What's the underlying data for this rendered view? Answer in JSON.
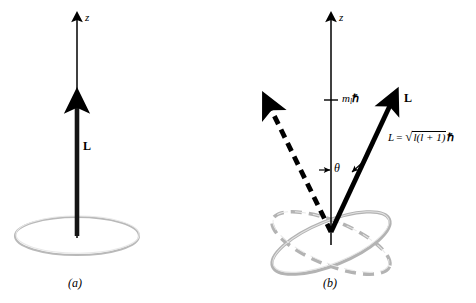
{
  "figure": {
    "background_color": "#ffffff",
    "ink_color": "#000000",
    "orbit_color": "#b3b3b3",
    "panels": [
      {
        "id": "a",
        "caption": "(a)",
        "axis_label": "z",
        "vector_label": "L",
        "description": "Classical angular momentum vector L aligned with the z axis above a flat circular orbit disk",
        "elements": [
          "z-axis-arrow",
          "angular-momentum-vector",
          "orbit-disk",
          "panel-caption"
        ]
      },
      {
        "id": "b",
        "caption": "(b)",
        "axis_label": "z",
        "vector_label": "L",
        "z_projection_label_parts": {
          "m": "m",
          "sub": "l",
          "hbar": "ℏ"
        },
        "z_projection_label": "m_l ℏ",
        "angle_label": "θ",
        "magnitude_formula_parts": {
          "lhs": "L",
          "equals": "=",
          "radical": "√",
          "radicand": "l(l + 1)",
          "hbar": "ℏ"
        },
        "magnitude_formula": "L = √(l(l+1)) ℏ",
        "description": "Quantized angular momentum: solid vector L at angle theta to z axis, dashed vector at the mirrored orientation, two tilted precession orbits",
        "elements": [
          "z-axis-arrow",
          "z-projection-tick",
          "angular-momentum-vector",
          "dashed-angular-momentum-vector",
          "angle-indicator",
          "orbit-ellipse-solid",
          "orbit-ellipse-dashed",
          "panel-caption"
        ]
      }
    ]
  }
}
